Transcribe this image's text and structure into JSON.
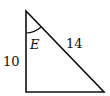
{
  "diagram": {
    "type": "right-triangle",
    "vertices": {
      "top": [
        26,
        11
      ],
      "bottom_left": [
        26,
        92
      ],
      "bottom_right": [
        104,
        92
      ]
    },
    "labels": {
      "angle": "E",
      "hypotenuse": "14",
      "vertical_leg": "10"
    },
    "stroke_color": "#111111"
  }
}
